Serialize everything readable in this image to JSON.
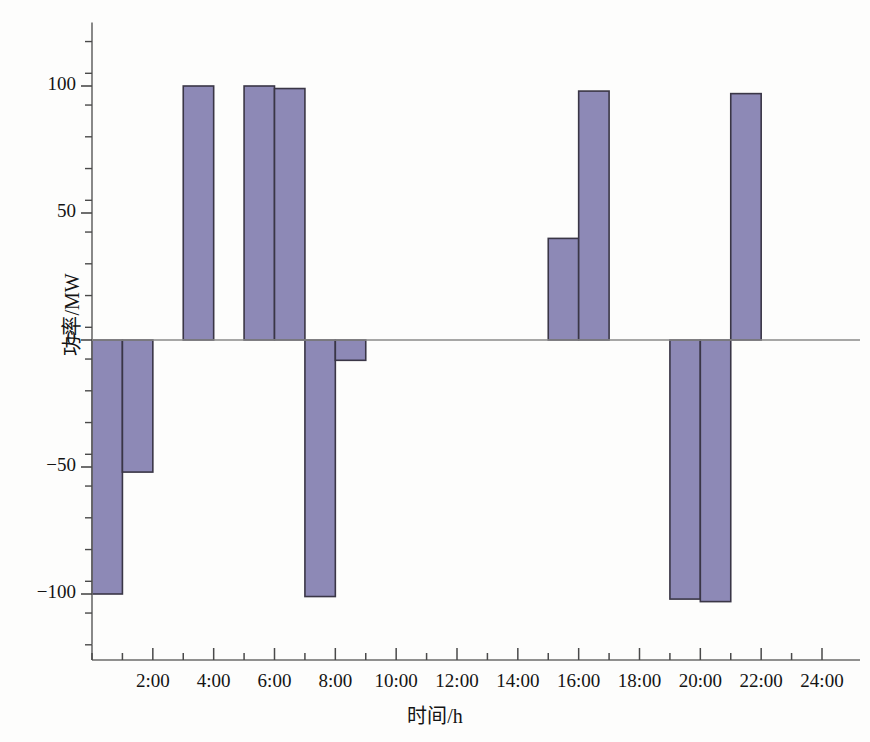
{
  "chart_data": {
    "type": "bar",
    "title": "",
    "xlabel": "时间/h",
    "ylabel": "功率/MW",
    "x_tick_labels": [
      "2:00",
      "4:00",
      "6:00",
      "8:00",
      "10:00",
      "12:00",
      "14:00",
      "16:00",
      "18:00",
      "20:00",
      "22:00",
      "24:00"
    ],
    "x_tick_values": [
      2,
      4,
      6,
      8,
      10,
      12,
      14,
      16,
      18,
      20,
      22,
      24
    ],
    "y_tick_labels": [
      "100",
      "50",
      "0",
      "−50",
      "−100"
    ],
    "y_tick_values": [
      100,
      50,
      0,
      -50,
      -100
    ],
    "xlim": [
      0,
      24
    ],
    "ylim": [
      -120,
      125
    ],
    "grid": false,
    "legend": null,
    "bar_color": "#8d89b6",
    "bar_edge_color": "#3a3646",
    "axis_color": "#6b6b6b",
    "minor_tick_interval_y": 12.5,
    "minor_tick_interval_x": 1,
    "bars": [
      {
        "label": "0:00–1:00",
        "x_start": 0,
        "x_end": 1,
        "value": -100
      },
      {
        "label": "1:00–2:00",
        "x_start": 1,
        "x_end": 2,
        "value": -52
      },
      {
        "label": "3:00–4:00",
        "x_start": 3,
        "x_end": 4,
        "value": 100
      },
      {
        "label": "5:00–6:00",
        "x_start": 5,
        "x_end": 6,
        "value": 100
      },
      {
        "label": "6:00–7:00",
        "x_start": 6,
        "x_end": 7,
        "value": 99
      },
      {
        "label": "7:00–8:00",
        "x_start": 7,
        "x_end": 8,
        "value": -101
      },
      {
        "label": "8:00–9:00",
        "x_start": 8,
        "x_end": 9,
        "value": -8
      },
      {
        "label": "15:00–16:00",
        "x_start": 15,
        "x_end": 16,
        "value": 40
      },
      {
        "label": "16:00–17:00",
        "x_start": 16,
        "x_end": 17,
        "value": 98
      },
      {
        "label": "19:00–20:00",
        "x_start": 19,
        "x_end": 20,
        "value": -102
      },
      {
        "label": "20:00–21:00",
        "x_start": 20,
        "x_end": 21,
        "value": -103
      },
      {
        "label": "21:00–22:00",
        "x_start": 21,
        "x_end": 22,
        "value": 97
      }
    ]
  }
}
